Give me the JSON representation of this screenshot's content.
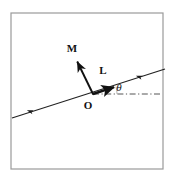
{
  "figure": {
    "type": "vector-diagram",
    "background_color": "#ffffff",
    "frame": {
      "name": "plot-frame",
      "stroke_color": "#9a9a9a",
      "stroke_width": 1.2,
      "x": 11,
      "y": 13,
      "width": 152,
      "height": 156
    },
    "labels": {
      "magnetization_vector": "M",
      "angular_momentum_vector": "L",
      "origin": "O",
      "angle": "θ"
    },
    "label_positions": {
      "magnetization_vector": {
        "x": 72,
        "y": 52
      },
      "angular_momentum_vector": {
        "x": 103,
        "y": 74
      },
      "origin": {
        "x": 88,
        "y": 108
      },
      "angle": {
        "x": 119,
        "y": 91
      }
    },
    "elements": [
      {
        "name": "axis-line",
        "description": "long inclined straight line through origin",
        "stroke_color": "#222222",
        "stroke_width": 1.1,
        "x1": 12,
        "y1": 118,
        "x2": 165,
        "y2": 69
      },
      {
        "name": "magnetization-arrow",
        "description": "bold arrow M from origin pointing up-left, perpendicular to axis",
        "stroke_color": "#111111",
        "stroke_width": 1.8,
        "x1": 93,
        "y1": 94,
        "x2": 76,
        "y2": 59
      },
      {
        "name": "angular-momentum-arrow",
        "description": "bold arrow L from origin along the inclined axis to upper right",
        "stroke_color": "#111111",
        "stroke_width": 2.2,
        "x1": 93,
        "y1": 94,
        "x2": 116,
        "y2": 86
      },
      {
        "name": "horizontal-dash-dot-reference-line",
        "description": "dash-dot horizontal reference line from origin to the right",
        "stroke_color": "#555555",
        "stroke_width": 1,
        "x1": 93,
        "y1": 94,
        "x2": 160,
        "y2": 94
      },
      {
        "name": "axis-tick-arrow-left",
        "description": "small arrowhead marker on lower-left part of axis line",
        "x": 30,
        "y": 112
      },
      {
        "name": "axis-tick-arrow-right",
        "description": "small arrowhead marker on upper-right part of axis line",
        "x": 139,
        "y": 77
      }
    ],
    "angle_arc": {
      "name": "theta-arc",
      "description": "arc between dashed horizontal and inclined L direction",
      "radius": 24,
      "start_deg": 0,
      "end_deg": 17
    }
  }
}
